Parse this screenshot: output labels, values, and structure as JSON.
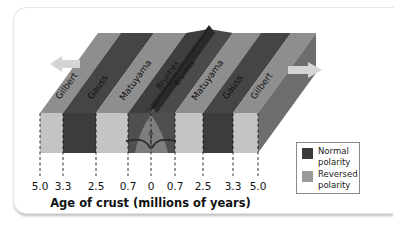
{
  "diagram": {
    "type": "seafloor-spreading magnetic striping block diagram",
    "stripes_left_to_right": [
      {
        "label": "Gilbert",
        "polarity": "reversed"
      },
      {
        "label": "Gauss",
        "polarity": "normal"
      },
      {
        "label": "Matuyama",
        "polarity": "reversed"
      },
      {
        "label": "Brunhes",
        "polarity": "normal"
      },
      {
        "label": "Brunhes",
        "polarity": "normal"
      },
      {
        "label": "Matuyama",
        "polarity": "reversed"
      },
      {
        "label": "Gauss",
        "polarity": "normal"
      },
      {
        "label": "Gilbert",
        "polarity": "reversed"
      }
    ],
    "arrows": {
      "left": "spreading-arrow-left",
      "right": "spreading-arrow-right"
    },
    "center_feature": "mid-ocean ridge with upwelling magma"
  },
  "axis": {
    "ticks": [
      "5.0",
      "3.3",
      "2.5",
      "0.7",
      "0",
      "0.7",
      "2.5",
      "3.3",
      "5.0"
    ],
    "title": "Age of crust (millions of years)"
  },
  "legend": {
    "items": [
      {
        "label_line1": "Normal",
        "label_line2": "polarity",
        "color": "#3a3a3a"
      },
      {
        "label_line1": "Reversed",
        "label_line2": "polarity",
        "color": "#9a9a9a"
      }
    ]
  },
  "colors": {
    "normal_top": "#4a4a4a",
    "normal_front": "#3c3c3c",
    "reversed_top": "#8e8e8e",
    "reversed_front": "#c4c4c4",
    "side_face": "#6e6e6e",
    "arrow": "#d0d0d0"
  }
}
